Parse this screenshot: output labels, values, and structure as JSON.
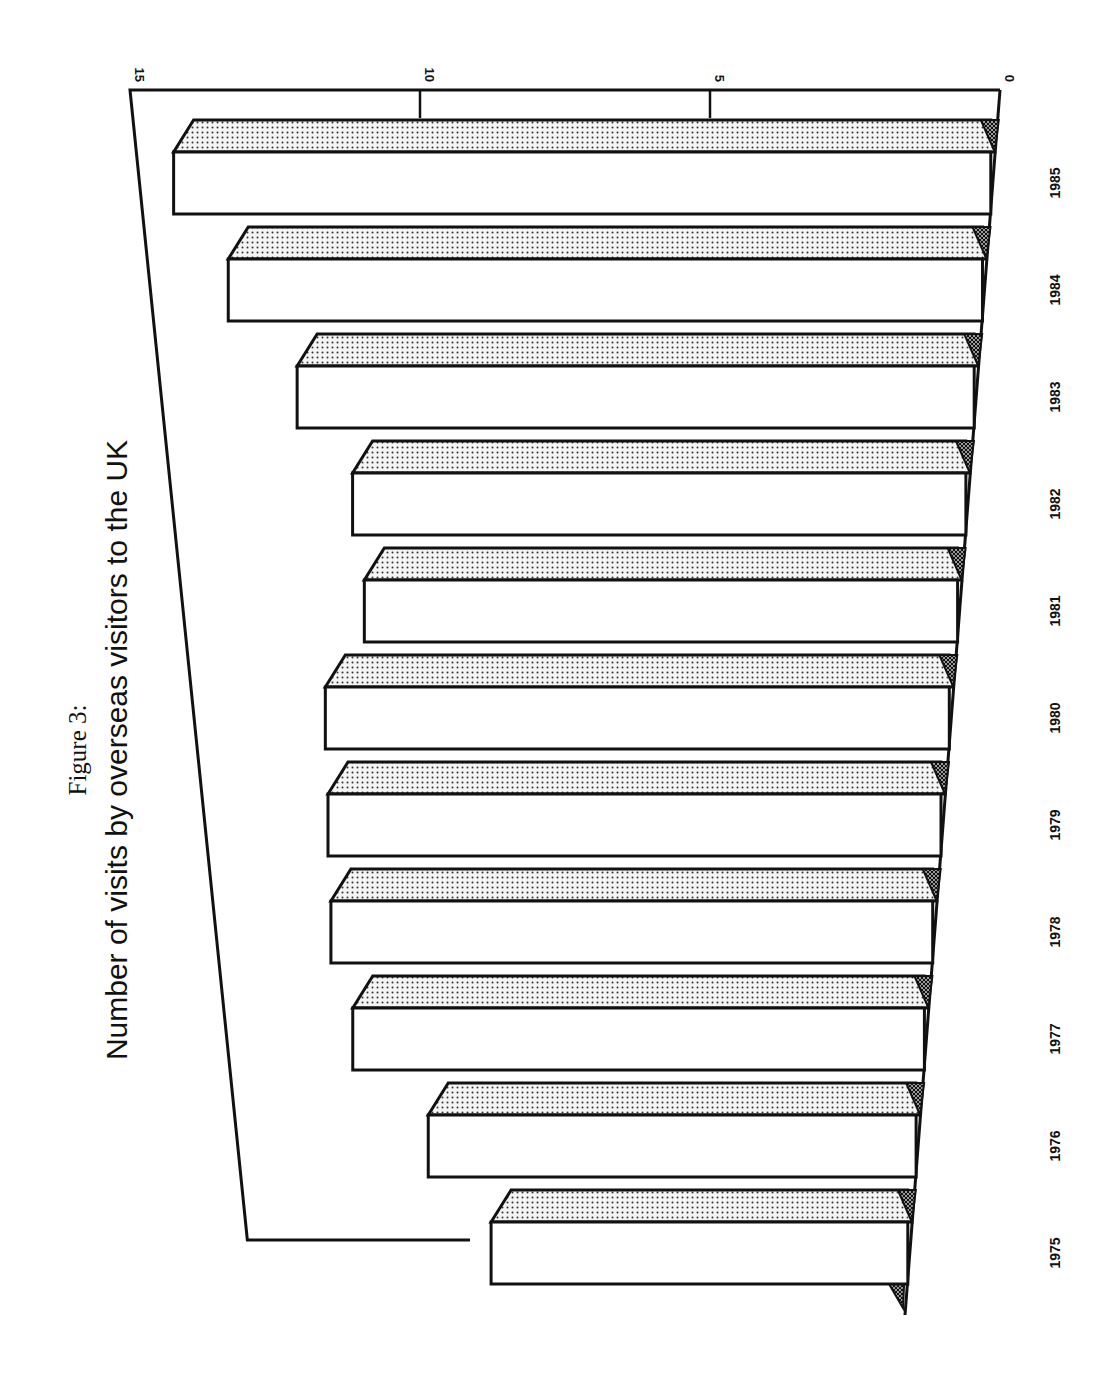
{
  "figure": {
    "label": "Figure 3:",
    "title": "Number of visits by overseas visitors to the UK"
  },
  "axis": {
    "ticks": [
      "0",
      "5",
      "10",
      "15"
    ]
  },
  "chart_data": {
    "type": "bar",
    "orientation": "rotated 90° (3D horizontal bars, page rotated)",
    "title": "Number of visits by overseas visitors to the UK",
    "subtitle": "Figure 3:",
    "xlabel": "",
    "ylabel": "",
    "categories": [
      "1975",
      "1976",
      "1977",
      "1978",
      "1979",
      "1980",
      "1981",
      "1982",
      "1983",
      "1984",
      "1985"
    ],
    "values": [
      9.5,
      10.8,
      12.3,
      12.6,
      12.5,
      12.4,
      11.5,
      11.6,
      12.5,
      13.6,
      14.4
    ],
    "ylim": [
      0,
      15
    ],
    "yticks": [
      0,
      5,
      10,
      15
    ],
    "grid": false,
    "legend": null
  }
}
